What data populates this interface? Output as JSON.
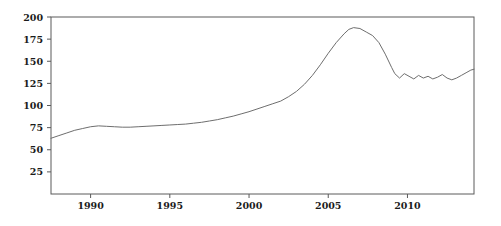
{
  "chart_data": {
    "type": "line",
    "title": "",
    "subtitle": "",
    "xlabel": "",
    "ylabel": "",
    "xlim": [
      1987.5,
      2014.2
    ],
    "ylim": [
      0,
      200
    ],
    "grid": false,
    "legend": null,
    "x_ticks": [
      1990,
      1995,
      2000,
      2005,
      2010
    ],
    "x_tick_labels": [
      "1990",
      "1995",
      "2000",
      "2005",
      "2010"
    ],
    "y_ticks": [
      25,
      50,
      75,
      100,
      125,
      150,
      175,
      200
    ],
    "y_tick_labels": [
      "25",
      "50",
      "75",
      "100",
      "125",
      "150",
      "175",
      "200"
    ],
    "series": [
      {
        "name": "index",
        "color": "#6e6e6e",
        "x": [
          1987.5,
          1988.0,
          1988.5,
          1989.0,
          1989.5,
          1990.0,
          1990.5,
          1991.0,
          1991.5,
          1992.0,
          1992.5,
          1993.0,
          1993.5,
          1994.0,
          1994.5,
          1995.0,
          1995.5,
          1996.0,
          1996.5,
          1997.0,
          1997.5,
          1998.0,
          1998.5,
          1999.0,
          1999.5,
          2000.0,
          2000.5,
          2001.0,
          2001.5,
          2002.0,
          2002.5,
          2003.0,
          2003.5,
          2004.0,
          2004.5,
          2005.0,
          2005.5,
          2006.0,
          2006.3,
          2006.6,
          2007.0,
          2007.4,
          2007.8,
          2008.2,
          2008.6,
          2009.0,
          2009.2,
          2009.5,
          2009.8,
          2010.1,
          2010.4,
          2010.7,
          2011.0,
          2011.3,
          2011.6,
          2011.9,
          2012.2,
          2012.5,
          2012.8,
          2013.1,
          2013.4,
          2013.7,
          2014.0,
          2014.2
        ],
        "y": [
          63,
          66,
          69,
          72,
          74,
          76,
          77,
          76.5,
          76,
          75.5,
          75.5,
          76,
          76.5,
          77,
          77.5,
          78,
          78.5,
          79,
          80,
          81,
          82.5,
          84,
          86,
          88,
          90.5,
          93,
          96,
          99,
          102,
          105,
          110,
          116,
          124,
          134,
          146,
          159,
          171,
          181,
          186,
          188,
          187,
          183,
          179,
          171,
          158,
          143,
          136,
          131,
          136,
          133,
          130,
          134,
          131,
          133,
          130,
          132,
          135,
          131,
          129,
          131,
          134,
          137,
          140,
          141
        ]
      }
    ]
  }
}
